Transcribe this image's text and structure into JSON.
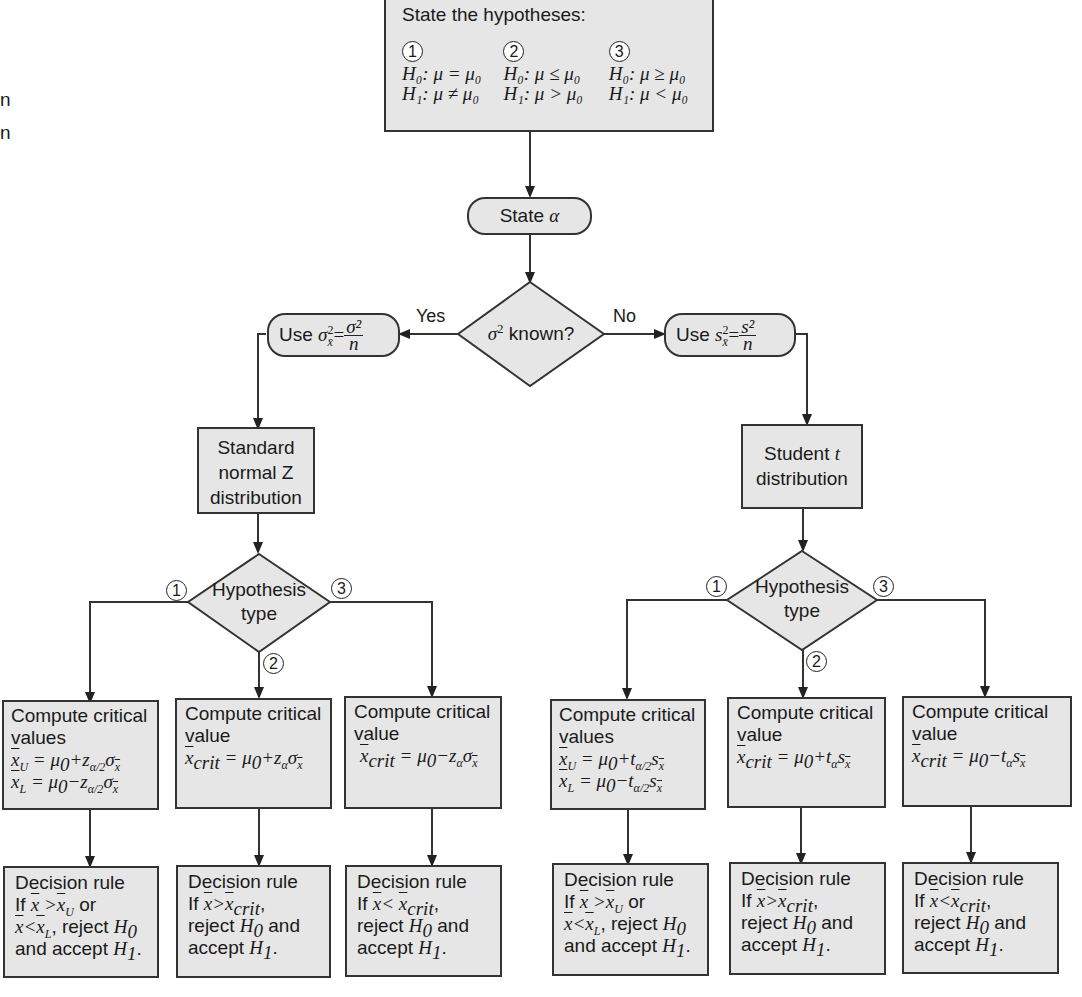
{
  "margin_text": [
    "n",
    "n"
  ],
  "start": {
    "title": "State the hypotheses:",
    "hypotheses": [
      {
        "num": "1",
        "h0": "H₀: μ = μ₀",
        "h1": "H₁: μ ≠ μ₀"
      },
      {
        "num": "2",
        "h0": "H₀: μ ≤ μ₀",
        "h1": "H₁: μ > μ₀"
      },
      {
        "num": "3",
        "h0": "H₀: μ ≥ μ₀",
        "h1": "H₁: μ < μ₀"
      }
    ]
  },
  "state_alpha": {
    "label": "State",
    "symbol": "α"
  },
  "sigma_decision": {
    "symbol": "σ",
    "sup": "2",
    "label": " known?",
    "yes": "Yes",
    "no": "No"
  },
  "use_sigma": {
    "label": "Use ",
    "lhs": "σ",
    "lhs_sup": "2",
    "lhs_sub": "x̄",
    "num": "σ²",
    "den": "n"
  },
  "use_s": {
    "label": "Use ",
    "lhs": "s",
    "lhs_sup": "2",
    "lhs_sub": "x̄",
    "num": "s²",
    "den": "n"
  },
  "z_dist": {
    "lines": [
      "Standard",
      "normal Z",
      "distribution"
    ]
  },
  "t_dist": {
    "line1": "Student ",
    "t": "t",
    "line2": "distribution"
  },
  "hyp_type": {
    "line1": "Hypothesis",
    "line2": "type",
    "branches": [
      "1",
      "2",
      "3"
    ]
  },
  "z_compute": [
    {
      "title": "Compute critical",
      "sub": "values",
      "formulas": [
        "x̄ᵤ = μ₀+z_{α/2}σ_x̄",
        "x̄ₗ = μ₀−z_{α/2}σ_x̄"
      ]
    },
    {
      "title": "Compute critical",
      "sub": "value",
      "formulas": [
        "x̄_crit = μ₀+z_ασ_x̄"
      ]
    },
    {
      "title": "Compute critical",
      "sub": "value",
      "formulas": [
        "x̄_crit = μ₀−z_ασ_x̄"
      ]
    }
  ],
  "t_compute": [
    {
      "title": "Compute critical",
      "sub": "values",
      "formulas": [
        "x̄ᵤ = μ₀+t_{α/2}s_x̄",
        "x̄ₗ = μ₀−t_{α/2}s_x̄"
      ]
    },
    {
      "title": "Compute critical",
      "sub": "value",
      "formulas": [
        "x̄_crit = μ₀+t_αs_x̄"
      ]
    },
    {
      "title": "Compute critical",
      "sub": "value",
      "formulas": [
        "x̄_crit = μ₀−t_αs_x̄"
      ]
    }
  ],
  "decision": [
    {
      "title": "Decision rule",
      "lines": [
        "If x̄ > x̄ᵤ or",
        "x̄ < x̄ₗ, reject H₀",
        "and accept H₁."
      ]
    },
    {
      "title": "Decision rule",
      "lines": [
        "If x̄ > x̄_crit,",
        "reject H₀ and",
        "accept H₁."
      ]
    },
    {
      "title": "Decision rule",
      "lines": [
        "If x̄ < x̄_crit,",
        "reject H₀ and",
        "accept H₁."
      ]
    }
  ],
  "labels": {
    "if": "If",
    "or": "or",
    "reject": "reject",
    "and": "and",
    "accept": "accept",
    "and_accept": "and accept",
    "crit": "crit",
    "comma": ","
  },
  "colors": {
    "box_fill": "#e6e6e6",
    "stroke": "#333333",
    "background": "#ffffff"
  }
}
